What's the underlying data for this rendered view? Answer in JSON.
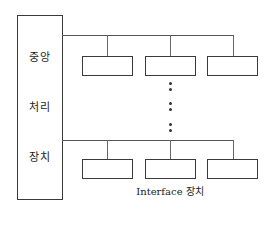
{
  "diagram": {
    "cpu": {
      "label_lines": [
        "중앙",
        "처리",
        "장치"
      ]
    },
    "interface_label": "Interface 장치",
    "top_row_devices": 3,
    "bottom_row_devices": 3,
    "ellipsis": "⋮"
  }
}
